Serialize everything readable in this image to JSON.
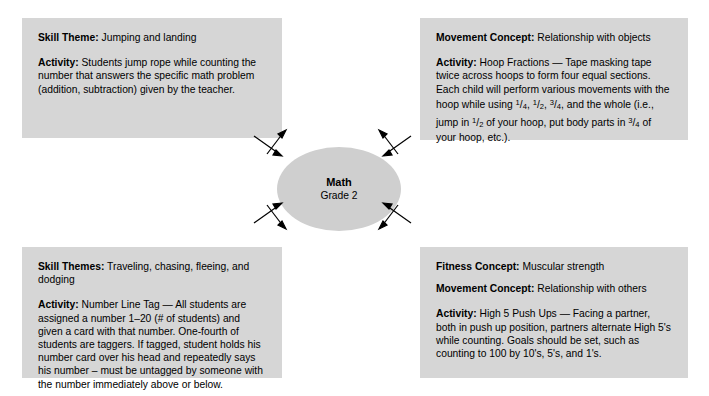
{
  "center": {
    "title": "Math",
    "subtitle": "Grade 2"
  },
  "panels": {
    "top_left": {
      "line1_label": "Skill Theme:",
      "line1_value": "Jumping and landing",
      "line2_label": "Activity:",
      "line2_value": "Students jump rope while counting the number that answers the specific math problem (addition, subtraction) given by the teacher."
    },
    "top_right": {
      "line1_label": "Movement Concept:",
      "line1_value": "Relationship with objects",
      "line2_label": "Activity:",
      "line2_value_a": "Hoop Fractions — Tape masking tape twice across hoops to form four equal sections. Each child will perform various movements with the hoop while using ",
      "frac1": "1/4",
      "sep1": ", ",
      "frac2": "1/2",
      "sep2": ", ",
      "frac3": "3/4",
      "line2_value_b": ", and the whole (i.e., jump in ",
      "frac4": "1/2",
      "line2_value_c": " of your hoop, put body parts in ",
      "frac5": "3/4",
      "line2_value_d": " of your hoop, etc.)."
    },
    "bottom_left": {
      "line1_label": "Skill Themes:",
      "line1_value": "Traveling, chasing, fleeing, and dodging",
      "line2_label": "Activity:",
      "line2_value": "Number Line Tag — All students are assigned a number 1–20 (# of students) and given a card with that number.  One-fourth of students are taggers.  If tagged, student holds his number card over his head and repeatedly says his number – must be untagged by someone with the number immediately above or below."
    },
    "bottom_right": {
      "line1_label": "Fitness Concept:",
      "line1_value": "Muscular strength",
      "line2_label": "Movement Concept:",
      "line2_value": "Relationship with others",
      "line3_label": "Activity:",
      "line3_value": "High 5 Push Ups — Facing a partner, both in push up position, partners alternate High 5's while counting.  Goals should be set, such as counting to 100 by 10's, 5's, and 1's."
    }
  },
  "connectors": {
    "top_left": "double-arrow-pair-diagonal",
    "top_right": "double-arrow-pair-diagonal",
    "bottom_left": "double-arrow-pair-diagonal",
    "bottom_right": "double-arrow-pair-diagonal"
  },
  "colors": {
    "panel_fill": "#d6d6d6",
    "ellipse_fill": "#cfcfcf",
    "text": "#000000",
    "background": "#ffffff"
  }
}
